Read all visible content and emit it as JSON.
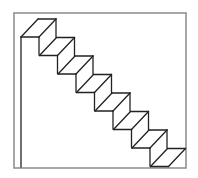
{
  "diagram": {
    "title": "",
    "frame": {
      "x": 14,
      "y": 13,
      "width": 172,
      "height": 155,
      "stroke": "#8a8a8a"
    },
    "stroke_color": "#222222",
    "step_count": 8,
    "step_dx": 18.5,
    "step_dy": 18.5,
    "first_step_back_left": [
      38,
      19
    ],
    "tread_depth_offset": [
      -17,
      18
    ],
    "tread_width": 18,
    "riser_height": 18,
    "left_wall": {
      "x": 21,
      "y_top": 37,
      "y_bottom": 167
    }
  }
}
